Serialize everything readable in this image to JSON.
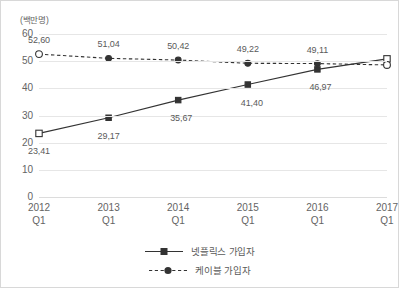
{
  "chart_data": {
    "type": "line",
    "title": "",
    "subtitle": "",
    "xlabel": "",
    "ylabel": "",
    "unit_label": "(백만명)",
    "categories": [
      "2012\nQ1",
      "2013\nQ1",
      "2014\nQ1",
      "2015\nQ1",
      "2016\nQ1",
      "2017\nQ1"
    ],
    "category_years": [
      "2012",
      "2013",
      "2014",
      "2015",
      "2016",
      "2017"
    ],
    "category_quarters": [
      "Q1",
      "Q1",
      "Q1",
      "Q1",
      "Q1",
      "Q1"
    ],
    "ylim": [
      0,
      60
    ],
    "yticks": [
      0,
      10,
      20,
      30,
      40,
      50,
      60
    ],
    "ytick_labels": [
      "0",
      "10",
      "20",
      "30",
      "40",
      "50",
      "60"
    ],
    "grid": true,
    "legend_position": "bottom",
    "decimal_separator": ",",
    "series": [
      {
        "name": "넷플릭스 가입자",
        "line_style": "solid",
        "marker": "square",
        "color": "#333333",
        "values": [
          23.41,
          29.17,
          35.67,
          41.4,
          46.97,
          50.85
        ],
        "value_labels": [
          "23,41",
          "29,17",
          "35,67",
          "41,40",
          "46,97",
          "50,85"
        ]
      },
      {
        "name": "케이블 가입자",
        "line_style": "dashed",
        "marker": "circle",
        "color": "#333333",
        "values": [
          52.6,
          51.04,
          50.42,
          49.22,
          49.11,
          48.61
        ],
        "value_labels": [
          "52,60",
          "51,04",
          "50,42",
          "49,22",
          "49,11",
          "48,61"
        ]
      }
    ]
  },
  "legend": {
    "items": [
      {
        "label": "넷플릭스 가입자"
      },
      {
        "label": "케이블 가입자"
      }
    ]
  },
  "colors": {
    "line": "#333333",
    "grid": "#e6e6e6",
    "text": "#646464",
    "border": "#d8d8d8",
    "background": "#ffffff"
  }
}
